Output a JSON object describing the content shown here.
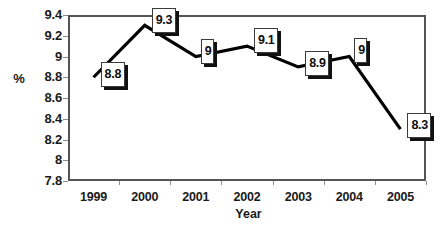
{
  "chart_data": {
    "type": "line",
    "title": "",
    "subtitle": "",
    "xlabel": "Year",
    "ylabel": "%",
    "categories": [
      "1999",
      "2000",
      "2001",
      "2002",
      "2003",
      "2004",
      "2005"
    ],
    "values": [
      8.8,
      9.3,
      9,
      9.1,
      8.9,
      9,
      8.3
    ],
    "point_labels": [
      "8.8",
      "9.3",
      "9",
      "9.1",
      "8.9",
      "9",
      "8.3"
    ],
    "ylim": [
      7.8,
      9.4
    ],
    "ytick_step": 0.2,
    "ytick_labels": [
      "9.4",
      "9.2",
      "9",
      "8.8",
      "8.6",
      "8.4",
      "8.2",
      "8",
      "7.8"
    ],
    "ytick_values": [
      9.4,
      9.2,
      9,
      8.8,
      8.6,
      8.4,
      8.2,
      8,
      7.8
    ],
    "grid": false,
    "legend": false,
    "legend_position": "none",
    "markers": false,
    "series": [
      {
        "name": "%",
        "values": [
          8.8,
          9.3,
          9,
          9.1,
          8.9,
          9,
          8.3
        ]
      }
    ],
    "colors": {
      "line": "#000000",
      "plot_border": "#555555",
      "axis_tick": "#8a8a8a",
      "text": "#1a1a1a",
      "label_box_fill": "#ffffff",
      "label_box_border": "#3b3b3b",
      "label_box_shadow": "#111111",
      "background": "#ffffff"
    }
  }
}
